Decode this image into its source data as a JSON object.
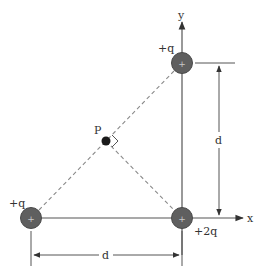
{
  "diagram": {
    "axes": {
      "x_label": "x",
      "y_label": "y"
    },
    "charges": [
      {
        "id": "top",
        "label": "+q",
        "sign_glyph": "+",
        "x": 182,
        "y": 63
      },
      {
        "id": "origin",
        "label": "+2q",
        "sign_glyph": "+",
        "x": 182,
        "y": 218
      },
      {
        "id": "left",
        "label": "+q",
        "sign_glyph": "+",
        "x": 31,
        "y": 218
      }
    ],
    "point": {
      "label": "P",
      "x": 106,
      "y": 141
    },
    "dimensions": {
      "vertical": {
        "label": "d"
      },
      "horizontal": {
        "label": "d"
      }
    },
    "colors": {
      "charge_fill": "#5f5f5f",
      "charge_stroke": "#4a4a4a",
      "line": "#555555",
      "dashed": "#8a8a8a",
      "text": "#333333"
    }
  }
}
